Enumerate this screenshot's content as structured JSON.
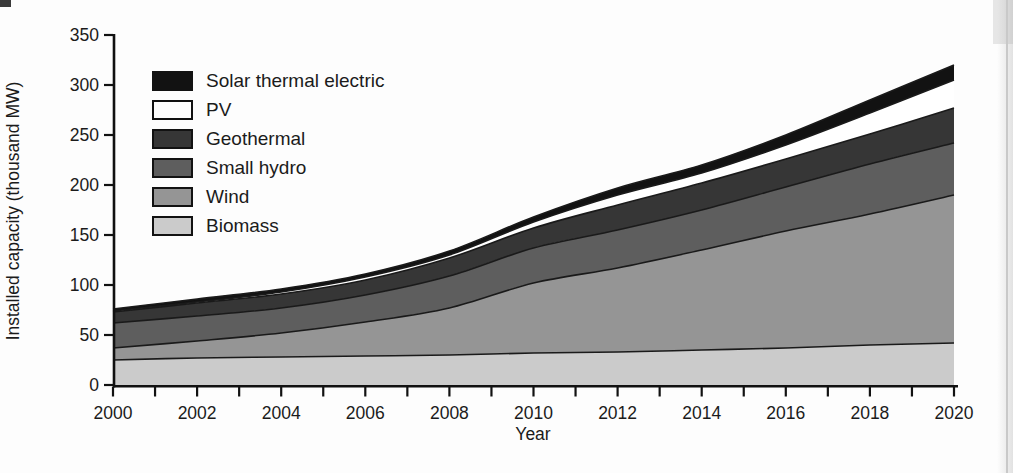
{
  "chart_data": {
    "type": "area",
    "stacked": true,
    "title": "",
    "xlabel": "Year",
    "ylabel": "Installed capacity (thousand MW)",
    "x": [
      2000,
      2002,
      2004,
      2006,
      2008,
      2010,
      2012,
      2014,
      2016,
      2018,
      2020
    ],
    "xlim": [
      2000,
      2020
    ],
    "ylim": [
      0,
      350
    ],
    "grid": false,
    "legend_position": "upper-left-inside",
    "x_tick_labels": [
      "2000",
      "2002",
      "2004",
      "2006",
      "2008",
      "2010",
      "2012",
      "2014",
      "2016",
      "2018",
      "2020"
    ],
    "x_minor_tick_every_years": 1,
    "y_tick_labels": [
      "0",
      "50",
      "100",
      "150",
      "200",
      "250",
      "300",
      "350"
    ],
    "series": [
      {
        "name": "Biomass",
        "color": "#cbcbcb",
        "values": [
          25,
          27,
          28,
          29,
          30,
          32,
          33,
          35,
          37,
          40,
          42
        ]
      },
      {
        "name": "Wind",
        "color": "#959595",
        "values": [
          12,
          17,
          24,
          34,
          47,
          70,
          84,
          100,
          117,
          131,
          148
        ]
      },
      {
        "name": "Small hydro",
        "color": "#5e5e5e",
        "values": [
          25,
          25,
          25,
          27,
          32,
          35,
          38,
          40,
          44,
          50,
          52
        ]
      },
      {
        "name": "Geothermal",
        "color": "#363636",
        "values": [
          11,
          13,
          14,
          15,
          18,
          20,
          25,
          27,
          28,
          30,
          35
        ]
      },
      {
        "name": "PV",
        "color": "#ffffff",
        "values": [
          1,
          1,
          2,
          3,
          3,
          6,
          10,
          10,
          14,
          21,
          28
        ]
      },
      {
        "name": "Solar thermal electric",
        "color": "#121212",
        "values": [
          2,
          3,
          3,
          3,
          4,
          5,
          7,
          8,
          10,
          13,
          15
        ]
      }
    ],
    "cumulative_totals": [
      76,
      86,
      96,
      111,
      134,
      168,
      197,
      220,
      250,
      285,
      320
    ]
  },
  "legend": {
    "items": [
      {
        "label": "Solar thermal electric",
        "color": "#121212"
      },
      {
        "label": "PV",
        "color": "#ffffff"
      },
      {
        "label": "Geothermal",
        "color": "#363636"
      },
      {
        "label": "Small hydro",
        "color": "#5e5e5e"
      },
      {
        "label": "Wind",
        "color": "#959595"
      },
      {
        "label": "Biomass",
        "color": "#cbcbcb"
      }
    ]
  }
}
